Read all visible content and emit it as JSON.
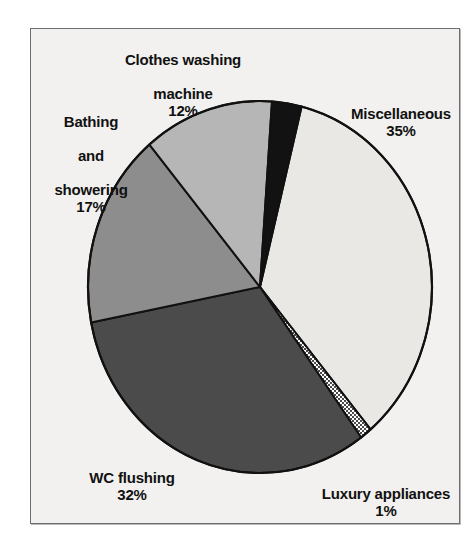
{
  "figure": {
    "background_color": "#ffffff",
    "panel_color": "#f2f1ef",
    "panel_border_color": "#6e6e6e"
  },
  "chart_data": {
    "type": "pie",
    "title": "",
    "subtitle": "",
    "xlabel": "",
    "ylabel": "",
    "legend_position": "none",
    "grid": false,
    "units": "percent",
    "total": 97,
    "categories": [
      "Miscellaneous",
      "Luxury appliances",
      "WC flushing",
      "Bathing and showering",
      "Clothes washing machine"
    ],
    "values": [
      35,
      1,
      32,
      17,
      12
    ],
    "slices": [
      {
        "label": "Miscellaneous",
        "label_lines": [
          "Miscellaneous"
        ],
        "value": 35,
        "percent_text": "35%",
        "color": "#e9e8e5",
        "pattern": "solid",
        "start_angle_deg": 14,
        "end_angle_deg": 140
      },
      {
        "label": "Luxury appliances",
        "label_lines": [
          "Luxury appliances"
        ],
        "value": 1,
        "percent_text": "1%",
        "color": "#d8d8d8",
        "pattern": "checker",
        "start_angle_deg": 140,
        "end_angle_deg": 144
      },
      {
        "label": "WC flushing",
        "label_lines": [
          "WC flushing"
        ],
        "value": 32,
        "percent_text": "32%",
        "color": "#4b4b4b",
        "pattern": "solid",
        "start_angle_deg": 144,
        "end_angle_deg": 259
      },
      {
        "label": "Bathing and showering",
        "label_lines": [
          "Bathing",
          "and",
          "showering"
        ],
        "value": 17,
        "percent_text": "17%",
        "color": "#8d8d8d",
        "pattern": "solid",
        "start_angle_deg": 259,
        "end_angle_deg": 320
      },
      {
        "label": "Clothes washing machine",
        "label_lines": [
          "Clothes washing",
          "machine"
        ],
        "value": 12,
        "percent_text": "12%",
        "color": "#b6b6b6",
        "pattern": "solid",
        "start_angle_deg": 320,
        "end_angle_deg": 4
      },
      {
        "label": "",
        "label_lines": [],
        "value": 3,
        "percent_text": "",
        "color": "#121212",
        "pattern": "solid",
        "start_angle_deg": 4,
        "end_angle_deg": 14
      }
    ],
    "geometry": {
      "center_x": 260,
      "center_y": 287,
      "radius_x": 172,
      "radius_y": 186,
      "outline_color": "#111111"
    }
  },
  "labels": {
    "clothes": {
      "line1": "Clothes washing",
      "line2": "machine",
      "pct": "12%"
    },
    "bathing": {
      "line1": "Bathing",
      "line2": "and",
      "line3": "showering",
      "pct": "17%"
    },
    "misc": {
      "line1": "Miscellaneous",
      "pct": "35%"
    },
    "wc": {
      "line1": "WC flushing",
      "pct": "32%"
    },
    "luxury": {
      "line1": "Luxury appliances",
      "pct": "1%"
    }
  }
}
